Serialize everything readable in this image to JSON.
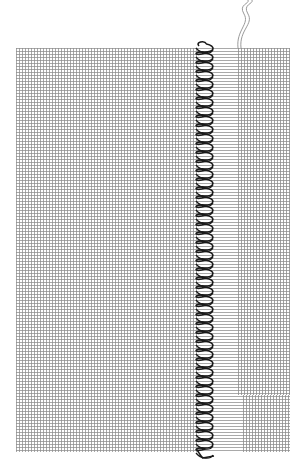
{
  "diagram": {
    "colors": {
      "background": "#ffffff",
      "grid_line": "#8c8c8c",
      "horizontal_thread": "#9a9a9a",
      "stitch": "#1a1a1a",
      "loose_thread": "#9a9a9a"
    },
    "fabric": {
      "left": 16,
      "top": 48,
      "right": 290,
      "bottom": 452,
      "grid_spacing": 3
    },
    "zones": {
      "woven_left": {
        "x_start": 16,
        "x_end": 197
      },
      "stitch": {
        "x_start": 195,
        "x_end": 214,
        "y_start": 44,
        "y_end": 458,
        "loop_pitch": 9
      },
      "withdrawn": {
        "x_start": 214,
        "x_end": 238,
        "lower_x_end": 243,
        "lower_y_start": 395
      },
      "woven_right": {
        "x_start": 238,
        "x_end": 290
      }
    },
    "loose_threads": [
      {
        "x_top": 248,
        "x_bottom": 238
      },
      {
        "x_top": 252,
        "x_bottom": 241
      }
    ]
  }
}
